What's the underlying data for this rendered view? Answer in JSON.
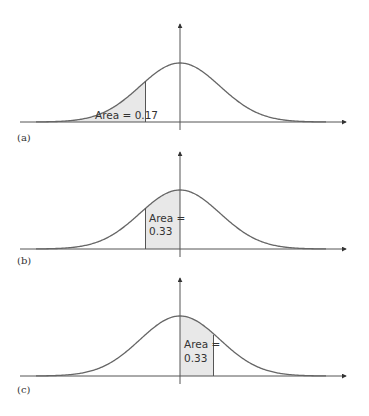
{
  "figure": {
    "panels": [
      {
        "id": "a",
        "label": "(a)",
        "annotation_lines": [
          "Area = 0.17"
        ],
        "shaded_region": "left tail up to z = -0.95",
        "area": 0.17
      },
      {
        "id": "b",
        "label": "(b)",
        "annotation_lines": [
          "Area =",
          "0.33"
        ],
        "shaded_region": "from z = -0.95 to mean",
        "area": 0.33
      },
      {
        "id": "c",
        "label": "(c)",
        "annotation_lines": [
          "Area =",
          "0.33"
        ],
        "shaded_region": "from mean to z = +0.95",
        "area": 0.33
      }
    ],
    "colors": {
      "curve": "#666666",
      "axis": "#444444",
      "shade": "#e8e8e8",
      "text": "#333333"
    }
  }
}
